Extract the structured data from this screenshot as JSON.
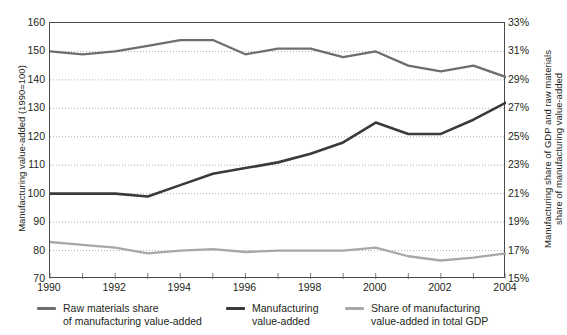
{
  "chart_data": {
    "type": "line",
    "title": "",
    "xlabel": "",
    "x": [
      1990,
      1991,
      1992,
      1993,
      1994,
      1995,
      1996,
      1997,
      1998,
      1999,
      2000,
      2001,
      2002,
      2003,
      2004
    ],
    "xticks": [
      1990,
      1992,
      1994,
      1996,
      1998,
      2000,
      2002,
      2004
    ],
    "xlim": [
      1990,
      2004
    ],
    "grid": true,
    "legend_position": "below",
    "left_axis": {
      "label": "Manufacturing value-added (1990=100)",
      "ticks": [
        70,
        80,
        90,
        100,
        110,
        120,
        130,
        140,
        150,
        160
      ],
      "lim": [
        70,
        160
      ]
    },
    "right_axis": {
      "label": "Manufacturing share of GDP and raw materials share of manufacturing value-added",
      "ticks": [
        "15%",
        "17%",
        "19%",
        "21%",
        "23%",
        "25%",
        "27%",
        "29%",
        "31%",
        "33%"
      ],
      "tick_values": [
        15,
        17,
        19,
        21,
        23,
        25,
        27,
        29,
        31,
        33
      ],
      "lim": [
        15,
        33
      ]
    },
    "series": [
      {
        "name": "Raw materials share of manufacturing value-added",
        "axis": "right",
        "color": "#6e6e6e",
        "values_left_scale": [
          150,
          149,
          150,
          152,
          154,
          154,
          149,
          151,
          151,
          148,
          150,
          145,
          143,
          145,
          141
        ],
        "values": [
          31.0,
          30.8,
          31.0,
          31.4,
          31.8,
          31.8,
          30.8,
          31.2,
          31.2,
          30.6,
          31.0,
          30.0,
          29.6,
          30.0,
          29.2
        ]
      },
      {
        "name": "Manufacturing value-added",
        "axis": "left",
        "color": "#3a3a3a",
        "values": [
          100,
          100,
          100,
          99,
          103,
          107,
          109,
          111,
          114,
          118,
          125,
          121,
          121,
          126,
          132
        ]
      },
      {
        "name": "Share of manufacturing value-added in total GDP",
        "axis": "right",
        "color": "#a8a8a8",
        "values_left_scale": [
          83,
          82,
          81,
          79,
          80,
          80.5,
          79.5,
          80,
          80,
          80,
          81,
          78,
          76.5,
          77.5,
          79
        ],
        "values": [
          17.4,
          17.2,
          17.0,
          16.6,
          16.8,
          16.9,
          16.7,
          16.8,
          16.8,
          16.8,
          17.0,
          16.4,
          16.1,
          16.3,
          16.6
        ]
      }
    ]
  },
  "legend": [
    {
      "label": "Raw materials share\nof manufacturing value-added",
      "color": "#6e6e6e"
    },
    {
      "label": "Manufacturing\nvalue-added",
      "color": "#3a3a3a"
    },
    {
      "label": "Share of manufacturing\nvalue-added in total GDP",
      "color": "#a8a8a8"
    }
  ],
  "axis_titles": {
    "left": "Manufacturing value-added (1990=100)",
    "right": "Manufacturing share of GDP and raw materials\nshare of manufacturing value-added"
  }
}
